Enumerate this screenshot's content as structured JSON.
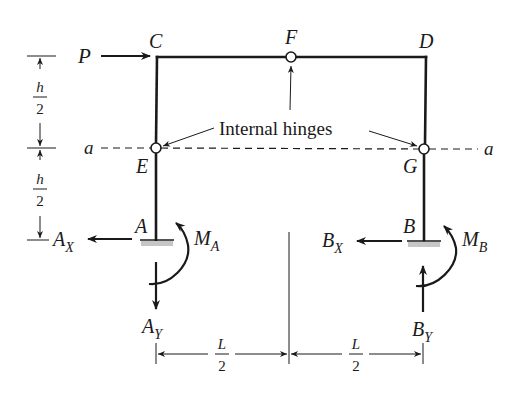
{
  "figure": {
    "points": {
      "C": "C",
      "F": "F",
      "D": "D",
      "E": "E",
      "G": "G",
      "A": "A",
      "B": "B"
    },
    "section_line": {
      "left_label": "a",
      "right_label": "a"
    },
    "annotation": "Internal hinges",
    "loads": {
      "applied_force": "P"
    },
    "reactions": {
      "A_x": {
        "base": "A",
        "sub": "X"
      },
      "A_y": {
        "base": "A",
        "sub": "Y"
      },
      "M_a": {
        "base": "M",
        "sub": "A"
      },
      "B_x": {
        "base": "B",
        "sub": "X"
      },
      "B_y": {
        "base": "B",
        "sub": "Y"
      },
      "M_b": {
        "base": "M",
        "sub": "B"
      }
    },
    "dimensions": {
      "vertical_upper": {
        "num": "h",
        "den": "2"
      },
      "vertical_lower": {
        "num": "h",
        "den": "2"
      },
      "horizontal_left": {
        "num": "L",
        "den": "2"
      },
      "horizontal_right": {
        "num": "L",
        "den": "2"
      }
    },
    "colors": {
      "line": "#1a1a1a",
      "support_hatch": "#b8b8b8",
      "background": "#ffffff"
    }
  }
}
